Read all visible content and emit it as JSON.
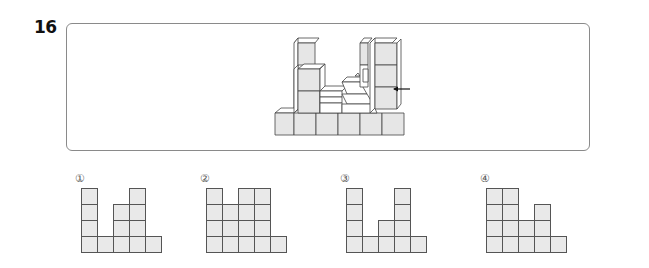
{
  "question": {
    "number": "16"
  },
  "figure": {
    "arrow_direction": "left",
    "colors": {
      "front_face": "#e6e6e6",
      "top_face": "#ffffff",
      "side_face": "#ffffff",
      "edge": "#444444"
    }
  },
  "options": [
    {
      "label": "①",
      "column_heights": [
        4,
        1,
        3,
        4,
        1
      ]
    },
    {
      "label": "②",
      "column_heights": [
        4,
        3,
        4,
        4,
        1
      ]
    },
    {
      "label": "③",
      "column_heights": [
        4,
        1,
        2,
        4,
        1
      ]
    },
    {
      "label": "④",
      "column_heights": [
        4,
        4,
        2,
        3,
        1
      ]
    }
  ],
  "style": {
    "cell_fill": "#e9e9e9",
    "cell_border": "#555555",
    "box_border": "#8a8a8a"
  }
}
